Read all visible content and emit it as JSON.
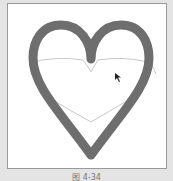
{
  "figure": {
    "caption": "图 4-34",
    "colors": {
      "background": "#e4e4e4",
      "canvas": "#ffffff",
      "frame_border": "#9a9a9a",
      "heart_stroke": "#6e6e6e",
      "guide_stroke": "#c8c8c8"
    },
    "shapes": {
      "heart": "heart-outline-thick",
      "guides": "heart-guide-curves"
    },
    "cursor": "arrow-cursor"
  }
}
